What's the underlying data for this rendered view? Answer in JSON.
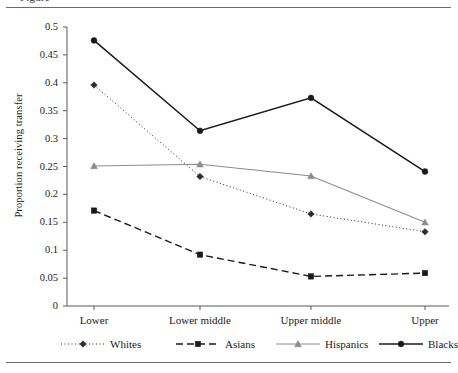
{
  "figure": {
    "caption_fragment": "Figure",
    "rule_color": "#6a6a6a"
  },
  "chart_data": {
    "type": "line",
    "title": "",
    "xlabel": "",
    "ylabel": "Proportion receiving transfer",
    "categories": [
      "Lower",
      "Lower middle",
      "Upper middle",
      "Upper"
    ],
    "ylim": [
      0,
      0.5
    ],
    "ytick_labels": [
      "0",
      "0.05",
      "0.1",
      "0.15",
      "0.2",
      "0.25",
      "0.3",
      "0.35",
      "0.4",
      "0.45",
      "0.5"
    ],
    "ytick_values": [
      0,
      0.05,
      0.1,
      0.15,
      0.2,
      0.25,
      0.3,
      0.35,
      0.4,
      0.45,
      0.5
    ],
    "grid": false,
    "legend_position": "below",
    "series": [
      {
        "name": "Whites",
        "values": [
          0.396,
          0.232,
          0.165,
          0.133
        ],
        "color": "#2b2b2b",
        "marker": "diamond",
        "dash": "1,2.5",
        "width": 1
      },
      {
        "name": "Asians",
        "values": [
          0.171,
          0.092,
          0.053,
          0.059
        ],
        "color": "#1a1a1a",
        "marker": "square",
        "dash": "7,4",
        "width": 1.4
      },
      {
        "name": "Hispanics",
        "values": [
          0.251,
          0.254,
          0.233,
          0.15
        ],
        "color": "#8c8c8c",
        "marker": "triangle",
        "dash": "none",
        "width": 1.1
      },
      {
        "name": "Blacks",
        "values": [
          0.476,
          0.314,
          0.373,
          0.241
        ],
        "color": "#1a1a1a",
        "marker": "circle",
        "dash": "none",
        "width": 1.5
      }
    ]
  },
  "legend": {
    "items": [
      {
        "label": "Whites"
      },
      {
        "label": "Asians"
      },
      {
        "label": "Hispanics"
      },
      {
        "label": "Blacks"
      }
    ]
  }
}
